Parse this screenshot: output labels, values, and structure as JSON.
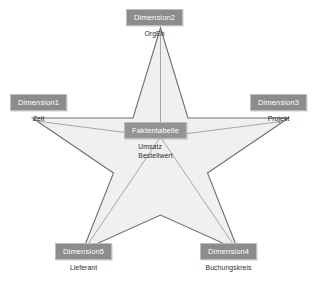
{
  "diagram": {
    "type": "star-schema",
    "colors": {
      "chip_fill": "#8c8c8c",
      "chip_text": "#ffffff",
      "star_fill": "#f0f0f0",
      "star_stroke": "#707070",
      "connector_stroke": "#9a9a9a",
      "background": "#ffffff",
      "attribute_text": "#2b2b2b"
    },
    "fact_table": {
      "label": "Faktentabelle",
      "attributes": [
        "Umsatz",
        "Bestellwert"
      ]
    },
    "dimensions": [
      {
        "id": "dimension-2",
        "label": "Dimension2",
        "attributes": [
          "OrgEh"
        ],
        "position": "top"
      },
      {
        "id": "dimension-1",
        "label": "Dimension1",
        "attributes": [
          "Zeit"
        ],
        "position": "left"
      },
      {
        "id": "dimension-3",
        "label": "Dimension3",
        "attributes": [
          "Projekt"
        ],
        "position": "right"
      },
      {
        "id": "dimension-5",
        "label": "Dimension5",
        "attributes": [
          "Lieferant"
        ],
        "position": "bottom-left"
      },
      {
        "id": "dimension-4",
        "label": "Dimension4",
        "attributes": [
          "Buchungskreis"
        ],
        "position": "bottom-right"
      }
    ]
  }
}
